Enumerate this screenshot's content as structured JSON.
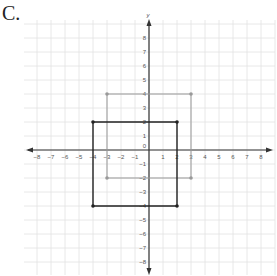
{
  "problem_label": "C.",
  "chart_data": {
    "type": "scatter",
    "title": "",
    "xlabel": "",
    "ylabel": "y",
    "xlim": [
      -9,
      9
    ],
    "ylim": [
      -9,
      9
    ],
    "grid": true,
    "x_ticks": [
      -8,
      -7,
      -6,
      -5,
      -4,
      -3,
      -2,
      -1,
      1,
      2,
      3,
      4,
      5,
      6,
      7,
      8
    ],
    "y_ticks": [
      8,
      7,
      6,
      5,
      4,
      3,
      2,
      1,
      -1,
      -2,
      -3,
      -4,
      -5,
      -6,
      -7,
      -8
    ],
    "origin_label": "0",
    "series": [
      {
        "name": "gray-square",
        "color": "#999999",
        "points": [
          [
            -3,
            4
          ],
          [
            3,
            4
          ],
          [
            3,
            -2
          ],
          [
            -3,
            -2
          ]
        ]
      },
      {
        "name": "black-square",
        "color": "#222222",
        "points": [
          [
            -4,
            2
          ],
          [
            2,
            2
          ],
          [
            2,
            -4
          ],
          [
            -4,
            -4
          ]
        ]
      }
    ]
  }
}
